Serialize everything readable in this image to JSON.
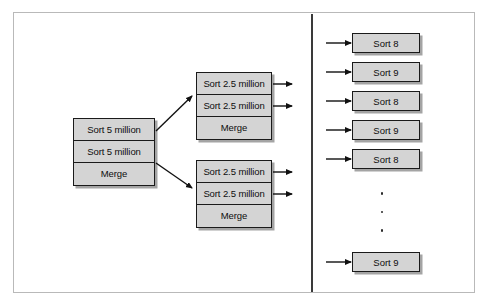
{
  "diagram": {
    "colors": {
      "box_fill": "#d4d4d4",
      "box_border": "#1a1a1a",
      "frame_border": "#b9b9b9",
      "divider": "#3a3a3a",
      "background": "#ffffff"
    },
    "left_group": {
      "name": "master-node-group",
      "cells": [
        {
          "label": "Sort 5 million"
        },
        {
          "label": "Sort 5 million"
        },
        {
          "label": "Merge"
        }
      ]
    },
    "middle_groups": [
      {
        "name": "intermediate-node-group-1",
        "cells": [
          {
            "label": "Sort 2.5 million"
          },
          {
            "label": "Sort 2.5 million"
          },
          {
            "label": "Merge"
          }
        ]
      },
      {
        "name": "intermediate-node-group-2",
        "cells": [
          {
            "label": "Sort 2.5 million"
          },
          {
            "label": "Sort 2.5 million"
          },
          {
            "label": "Merge"
          }
        ]
      }
    ],
    "right_leaves": [
      {
        "label": "Sort 8",
        "top": 33
      },
      {
        "label": "Sort 9",
        "top": 62
      },
      {
        "label": "Sort 8",
        "top": 91
      },
      {
        "label": "Sort 9",
        "top": 120
      },
      {
        "label": "Sort 8",
        "top": 149
      },
      {
        "label": "Sort 9",
        "top": 252
      }
    ],
    "ellipsis": {
      "name": "vertical-ellipsis",
      "dot_count": 3
    }
  }
}
